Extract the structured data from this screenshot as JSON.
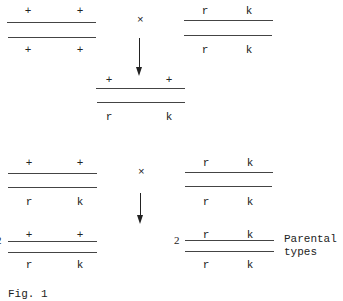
{
  "cross1": {
    "parent_left": {
      "top": [
        "+",
        "+"
      ],
      "bottom": [
        "+",
        "+"
      ]
    },
    "operator": "×",
    "parent_right": {
      "top": [
        "r",
        "k"
      ],
      "bottom": [
        "r",
        "k"
      ]
    },
    "offspring": {
      "top": [
        "+",
        "+"
      ],
      "bottom": [
        "r",
        "k"
      ]
    }
  },
  "cross2": {
    "parent_left": {
      "top": [
        "+",
        "+"
      ],
      "bottom": [
        "r",
        "k"
      ]
    },
    "operator": "×",
    "parent_right": {
      "top": [
        "r",
        "k"
      ],
      "bottom": [
        "r",
        "k"
      ]
    },
    "offspring_left": {
      "count": "2",
      "top": [
        "+",
        "+"
      ],
      "bottom": [
        "r",
        "k"
      ]
    },
    "offspring_right": {
      "count": "2",
      "top": [
        "r",
        "k"
      ],
      "bottom": [
        "r",
        "k"
      ],
      "label_line1": "Parental",
      "label_line2": "types"
    }
  },
  "caption": "Fig. 1"
}
